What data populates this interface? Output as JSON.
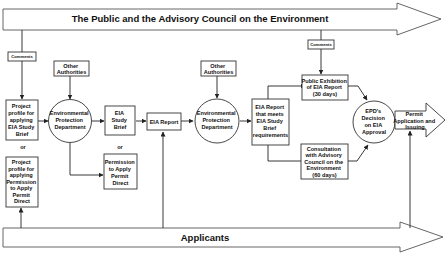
{
  "diagram": {
    "top_lane": {
      "label": "The Public and the Advisory Council on the Environment"
    },
    "bottom_lane": {
      "label": "Applicants"
    },
    "comments_left": {
      "label": "Comments"
    },
    "comments_right": {
      "label": "Comments"
    },
    "other_authorities_1": {
      "lines": [
        "Other",
        "Authorities"
      ]
    },
    "other_authorities_2": {
      "lines": [
        "Other",
        "Authorities"
      ]
    },
    "project_profile_study_brief": {
      "lines": [
        "Project",
        "profile for",
        "applying",
        "EIA Study",
        "Brief"
      ]
    },
    "or_left": {
      "label": "or"
    },
    "project_profile_permit_direct": {
      "lines": [
        "Project",
        "profile for",
        "applying",
        "Permission",
        "to Apply",
        "Permit",
        "Direct"
      ]
    },
    "epd_1": {
      "lines": [
        "Environmental",
        "Protection",
        "Department"
      ]
    },
    "eia_study_brief": {
      "lines": [
        "EIA",
        "Study",
        "Brief"
      ]
    },
    "or_middle": {
      "label": "or"
    },
    "permission_permit_direct": {
      "lines": [
        "Permission",
        "to Apply",
        "Permit",
        "Direct"
      ]
    },
    "eia_report": {
      "label": "EIA Report"
    },
    "epd_2": {
      "lines": [
        "Environmental",
        "Protection",
        "Department"
      ]
    },
    "eia_report_meets": {
      "lines": [
        "EIA Report",
        "that meets",
        "EIA Study",
        "Brief",
        "requirements"
      ]
    },
    "public_exhibition": {
      "lines": [
        "Public Exhibition",
        "of EIA Report",
        "(30 days)"
      ]
    },
    "consultation": {
      "lines": [
        "Consultation",
        "with Advisory",
        "Council on the",
        "Environment",
        "(60 days)"
      ]
    },
    "epd_decision": {
      "lines": [
        "EPD's",
        "Decision",
        "on EIA",
        "Approval"
      ]
    },
    "permit_application": {
      "lines": [
        "Permit",
        "Application and",
        "Issuing"
      ]
    }
  }
}
